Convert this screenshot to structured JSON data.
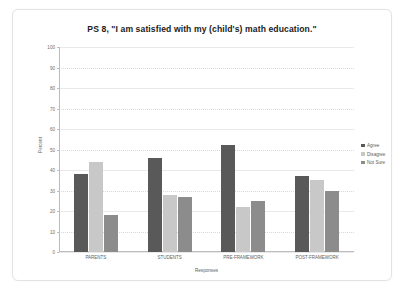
{
  "chart_data": {
    "type": "bar",
    "title": "PS 8, \"I am satisfied with my (child's) math education.\"",
    "xlabel": "Responses",
    "ylabel": "Percent",
    "ylim": [
      0,
      100
    ],
    "yticks": [
      0,
      10,
      20,
      30,
      40,
      50,
      60,
      70,
      80,
      90,
      100
    ],
    "grid": true,
    "legend_position": "right",
    "categories": [
      "PARENTS",
      "STUDENTS",
      "PRE-FRAMEWORK",
      "POST-FRAMEWORK"
    ],
    "series": [
      {
        "name": "Agree",
        "color": "#595959",
        "values": [
          38,
          46,
          52,
          37
        ]
      },
      {
        "name": "Disagree",
        "color": "#c8c8c8",
        "values": [
          44,
          28,
          22,
          35
        ]
      },
      {
        "name": "Not Sure",
        "color": "#8c8c8c",
        "values": [
          18,
          27,
          25,
          30
        ]
      }
    ]
  }
}
